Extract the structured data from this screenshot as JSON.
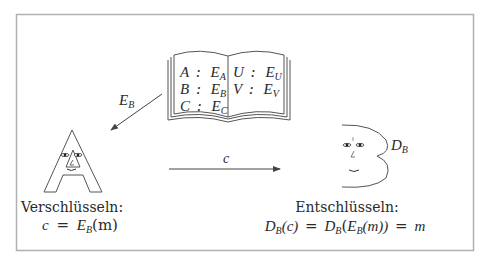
{
  "diagram": {
    "frame": {
      "border_color": "#b0b0b0"
    },
    "codebook": {
      "left_page": [
        {
          "letter": "A",
          "sep": ":",
          "key": "E",
          "sub": "A"
        },
        {
          "letter": "B",
          "sep": ":",
          "key": "E",
          "sub": "B"
        },
        {
          "letter": "C",
          "sep": ":",
          "key": "E",
          "sub": "C"
        }
      ],
      "right_page": [
        {
          "letter": "U",
          "sep": ":",
          "key": "E",
          "sub": "U"
        },
        {
          "letter": "V",
          "sep": ":",
          "key": "E",
          "sub": "V"
        }
      ]
    },
    "arrow_book_to_sender": {
      "label_main": "E",
      "label_sub": "B"
    },
    "arrow_sender_to_receiver": {
      "label": "c"
    },
    "receiver_key": {
      "label_main": "D",
      "label_sub": "B"
    },
    "sender": {
      "icon": "letter-a-face",
      "caption": "Verschlüsseln:",
      "formula": {
        "lhs": "c",
        "eq": "=",
        "fn": "E",
        "fn_sub": "B",
        "arg": "(m)"
      }
    },
    "receiver": {
      "icon": "letter-b-face",
      "caption": "Entschlüsseln:",
      "formula": {
        "p1_fn": "D",
        "p1_sub": "B",
        "p1_arg": "(c)",
        "eq1": "=",
        "p2_fn": "D",
        "p2_sub": "B",
        "p2_open": "(",
        "p3_fn": "E",
        "p3_sub": "B",
        "p3_arg": "(m))",
        "eq2": "=",
        "result": "m"
      }
    }
  }
}
